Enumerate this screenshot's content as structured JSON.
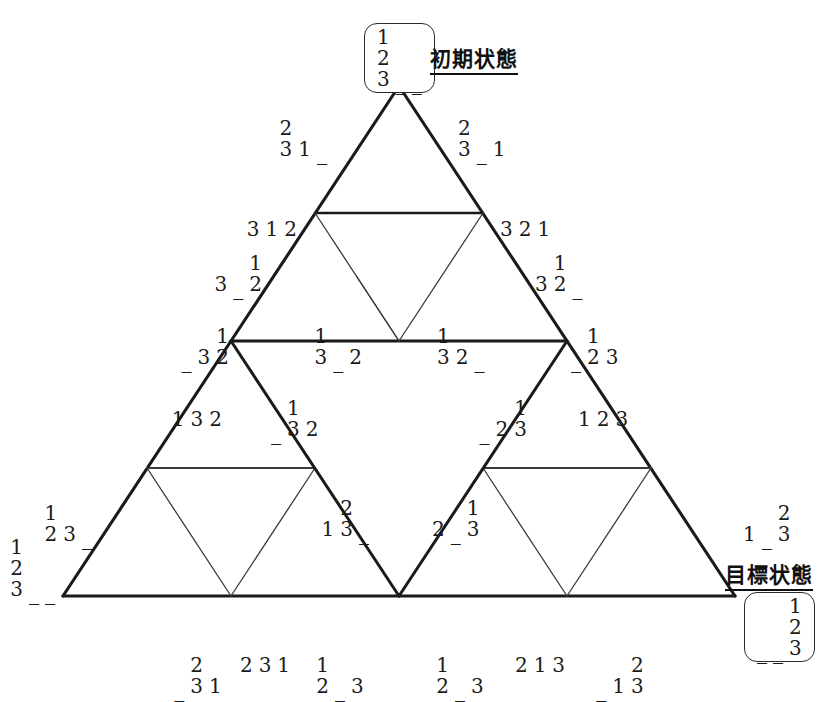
{
  "figure": {
    "type": "hanoi-state-graph",
    "puzzle_disks": 3,
    "pegs": 3
  },
  "captions": {
    "initial": "初期状態",
    "goal": "目標状態"
  },
  "endpoints": {
    "initial": {
      "name": "initial-state",
      "pegs": [
        [
          "1",
          "2",
          "3"
        ],
        [
          "_"
        ],
        [
          "_"
        ]
      ]
    },
    "goal": {
      "name": "goal-state",
      "pegs": [
        [
          "_"
        ],
        [
          "_"
        ],
        [
          "1",
          "2",
          "3"
        ]
      ]
    }
  },
  "colors": {
    "line": "#1a1a1a",
    "thin_line": "#555555",
    "text": "#1a1a1a",
    "background": "#ffffff"
  },
  "nodes": [
    {
      "id": "n-top",
      "label": "123/_/_",
      "pegs": [
        [
          "1",
          "2",
          "3"
        ],
        [
          "_"
        ],
        [
          "_"
        ]
      ],
      "x": 399,
      "y": 86,
      "anchor": "box-top"
    },
    {
      "id": "n-l1",
      "label": "23/1/_",
      "pegs": [
        [
          "2",
          "3"
        ],
        [
          "1"
        ],
        [
          "_"
        ]
      ],
      "x": 330,
      "y": 160,
      "anchor": "anch-r"
    },
    {
      "id": "n-r1",
      "label": "23/_/1",
      "pegs": [
        [
          "2",
          "3"
        ],
        [
          "_"
        ],
        [
          "1"
        ]
      ],
      "x": 455,
      "y": 160,
      "anchor": "anch-l"
    },
    {
      "id": "n-l2",
      "label": "3/1/2",
      "pegs": [
        [
          "3"
        ],
        [
          "1"
        ],
        [
          "2"
        ]
      ],
      "x": 300,
      "y": 240,
      "anchor": "anch-r"
    },
    {
      "id": "n-r2",
      "label": "3/2/1",
      "pegs": [
        [
          "3"
        ],
        [
          "2"
        ],
        [
          "1"
        ]
      ],
      "x": 497,
      "y": 240,
      "anchor": "anch-l"
    },
    {
      "id": "n-l3",
      "label": "3/_/12",
      "pegs": [
        [
          "3"
        ],
        [
          "_"
        ],
        [
          "1",
          "2"
        ]
      ],
      "x": 265,
      "y": 295,
      "anchor": "anch-r"
    },
    {
      "id": "n-r3",
      "label": "3/12/_",
      "pegs": [
        [
          "3"
        ],
        [
          "1",
          "2"
        ],
        [
          "_"
        ]
      ],
      "x": 532,
      "y": 295,
      "anchor": "anch-l"
    },
    {
      "id": "n-l4",
      "label": "_/3/12",
      "pegs": [
        [
          "_"
        ],
        [
          "3"
        ],
        [
          "1",
          "2"
        ]
      ],
      "x": 232,
      "y": 368,
      "anchor": "anch-r"
    },
    {
      "id": "n-r4",
      "label": "_/12/3",
      "pegs": [
        [
          "_"
        ],
        [
          "1",
          "2"
        ],
        [
          "3"
        ]
      ],
      "x": 568,
      "y": 368,
      "anchor": "anch-l"
    },
    {
      "id": "n-c1",
      "label": "13/_/2",
      "pegs": [
        [
          "1",
          "3"
        ],
        [
          "_"
        ],
        [
          "2"
        ]
      ],
      "x": 365,
      "y": 368,
      "anchor": "anch-r"
    },
    {
      "id": "n-c2",
      "label": "13/2/_",
      "pegs": [
        [
          "1",
          "3"
        ],
        [
          "2"
        ],
        [
          "_"
        ]
      ],
      "x": 434,
      "y": 368,
      "anchor": "anch-l"
    },
    {
      "id": "n-ll1",
      "label": "1/3/2",
      "pegs": [
        [
          "1"
        ],
        [
          "3"
        ],
        [
          "2"
        ]
      ],
      "x": 225,
      "y": 430,
      "anchor": "anch-r"
    },
    {
      "id": "n-lr1",
      "label": "_/13/2",
      "pegs": [
        [
          "_"
        ],
        [
          "1",
          "3"
        ],
        [
          "2"
        ]
      ],
      "x": 268,
      "y": 440,
      "anchor": "anch-l"
    },
    {
      "id": "n-rl1",
      "label": "_/2/13",
      "pegs": [
        [
          "_"
        ],
        [
          "2"
        ],
        [
          "1",
          "3"
        ]
      ],
      "x": 530,
      "y": 440,
      "anchor": "anch-r"
    },
    {
      "id": "n-rr1",
      "label": "1/2/3",
      "pegs": [
        [
          "1"
        ],
        [
          "2"
        ],
        [
          "3"
        ]
      ],
      "x": 575,
      "y": 430,
      "anchor": "anch-l"
    },
    {
      "id": "n-lc1",
      "label": "1/23/_",
      "pegs": [
        [
          "1"
        ],
        [
          "2",
          "3"
        ],
        [
          "_"
        ]
      ],
      "x": 372,
      "y": 540,
      "anchor": "anch-r"
    },
    {
      "id": "n-lc2",
      "label": "2/_/13",
      "pegs": [
        [
          "2"
        ],
        [
          "_"
        ],
        [
          "1",
          "3"
        ]
      ],
      "x": 429,
      "y": 540,
      "anchor": "anch-l"
    },
    {
      "id": "n-bl-corner",
      "label": "123/_/_",
      "pegs": [
        [
          "1",
          "2",
          "3"
        ],
        [
          "_"
        ],
        [
          "_"
        ]
      ],
      "x": 58,
      "y": 600,
      "anchor": "anch-r"
    },
    {
      "id": "n-bl1",
      "label": "12/3/_",
      "pegs": [
        [
          "1",
          "2"
        ],
        [
          "3"
        ],
        [
          "_"
        ]
      ],
      "x": 95,
      "y": 545,
      "anchor": "anch-r"
    },
    {
      "id": "n-bb1",
      "label": "_/23/1",
      "pegs": [
        [
          "_"
        ],
        [
          "2",
          "3"
        ],
        [
          "1"
        ]
      ],
      "x": 198,
      "y": 655,
      "anchor": "anch-tc"
    },
    {
      "id": "n-bb2",
      "label": "2/3/1",
      "pegs": [
        [
          "2"
        ],
        [
          "3"
        ],
        [
          "1"
        ]
      ],
      "x": 265,
      "y": 655,
      "anchor": "anch-tc"
    },
    {
      "id": "n-bb3",
      "label": "12/_/3",
      "pegs": [
        [
          "1",
          "2"
        ],
        [
          "_"
        ],
        [
          "3"
        ]
      ],
      "x": 340,
      "y": 655,
      "anchor": "anch-tc"
    },
    {
      "id": "n-bb4",
      "label": "12/_/3b",
      "pegs": [
        [
          "1",
          "2"
        ],
        [
          "_"
        ],
        [
          "3"
        ]
      ],
      "x": 460,
      "y": 655,
      "anchor": "anch-tc"
    },
    {
      "id": "n-bb5",
      "label": "2/1/3",
      "pegs": [
        [
          "2"
        ],
        [
          "1"
        ],
        [
          "3"
        ]
      ],
      "x": 540,
      "y": 655,
      "anchor": "anch-tc"
    },
    {
      "id": "n-bb6",
      "label": "_/1/23",
      "pegs": [
        [
          "_"
        ],
        [
          "1"
        ],
        [
          "2",
          "3"
        ]
      ],
      "x": 620,
      "y": 655,
      "anchor": "anch-tc"
    },
    {
      "id": "n-br1",
      "label": "1/_/23",
      "pegs": [
        [
          "1"
        ],
        [
          "_"
        ],
        [
          "2",
          "3"
        ]
      ],
      "x": 740,
      "y": 545,
      "anchor": "anch-l"
    },
    {
      "id": "n-br-corner",
      "label": "_/_/123",
      "pegs": [
        [
          "_"
        ],
        [
          "_"
        ],
        [
          "1",
          "2",
          "3"
        ]
      ],
      "x": 775,
      "y": 600,
      "anchor": "box-bottom"
    }
  ],
  "geometry": {
    "apex": {
      "x": 399,
      "y": 86
    },
    "bottom_left": {
      "x": 63,
      "y": 596
    },
    "bottom_right": {
      "x": 735,
      "y": 596
    }
  }
}
